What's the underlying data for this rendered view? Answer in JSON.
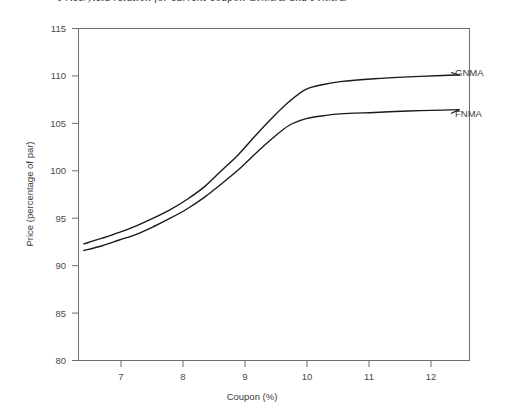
{
  "chart_data": {
    "type": "line",
    "title": "Price/yield relation for current-coupon GNMAs and FNMAs",
    "xlabel": "Coupon (%)",
    "ylabel": "Price (percentage of par)",
    "xlim": [
      6.65,
      12.4
    ],
    "ylim": [
      80,
      115
    ],
    "xticks": [
      7,
      8,
      9,
      10,
      11,
      12
    ],
    "xtick_labels": [
      "7",
      "8",
      "9",
      "10",
      "11",
      "12"
    ],
    "yticks": [
      80,
      85,
      90,
      95,
      100,
      105,
      110,
      115
    ],
    "ytick_labels": [
      "80",
      "85",
      "90",
      "95",
      "100",
      "105",
      "110",
      "115"
    ],
    "grid": false,
    "legend_position": "right-inline-labels",
    "series": [
      {
        "name": "GNMA",
        "label_text": "GNMA",
        "color": "#1a1a1a",
        "x": [
          6.73,
          7.0,
          7.25,
          7.5,
          7.75,
          8.0,
          8.25,
          8.5,
          8.75,
          9.0,
          9.25,
          9.5,
          9.75,
          10.0,
          10.25,
          10.5,
          11.0,
          11.5,
          12.0,
          12.25
        ],
        "values": [
          92.3,
          92.9,
          93.5,
          94.2,
          95.0,
          95.9,
          97.0,
          98.3,
          100.0,
          101.7,
          103.7,
          105.6,
          107.3,
          108.6,
          109.1,
          109.4,
          109.7,
          109.9,
          110.05,
          110.1
        ]
      },
      {
        "name": "FNMA",
        "label_text": "FNMA",
        "color": "#1a1a1a",
        "x": [
          6.73,
          7.0,
          7.25,
          7.5,
          7.75,
          8.0,
          8.25,
          8.5,
          8.75,
          9.0,
          9.25,
          9.5,
          9.75,
          10.0,
          10.25,
          10.5,
          11.0,
          11.5,
          12.0,
          12.25
        ],
        "values": [
          91.6,
          92.1,
          92.7,
          93.3,
          94.1,
          95.0,
          96.0,
          97.2,
          98.6,
          100.1,
          101.8,
          103.4,
          104.8,
          105.5,
          105.8,
          106.0,
          106.15,
          106.3,
          106.4,
          106.45
        ]
      }
    ]
  },
  "colors": {
    "frame": "#6e6e6e",
    "line": "#1a1a1a",
    "background": "#ffffff",
    "text": "#3b3b3b"
  }
}
